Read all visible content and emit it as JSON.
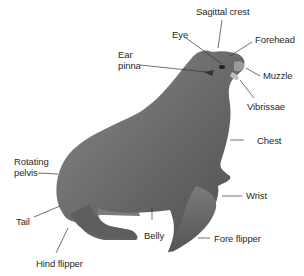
{
  "colors": {
    "body": "#6e6e6e",
    "body_dark": "#4a4a4a",
    "body_light": "#9a9a9a",
    "leader": "#333333",
    "text": "#2a2a2a"
  },
  "labels": {
    "sagittal_crest": "Sagittal crest",
    "eye": "Eye",
    "forehead": "Forehead",
    "ear_line1": "Ear",
    "ear_line2": "pinna",
    "muzzle": "Muzzle",
    "vibrissae": "Vibrissae",
    "chest": "Chest",
    "rotating_line1": "Rotating",
    "rotating_line2": "pelvis",
    "wrist": "Wrist",
    "tail": "Tail",
    "belly": "Belly",
    "fore_flipper": "Fore flipper",
    "hind_flipper": "Hind flipper"
  }
}
